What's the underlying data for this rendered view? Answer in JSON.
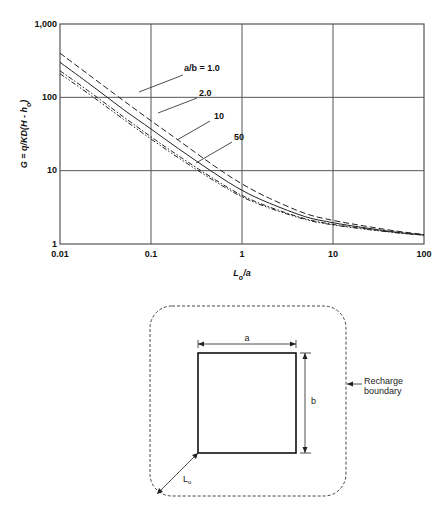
{
  "chart_data": {
    "type": "line",
    "title": "",
    "xlabel": "Lo/a",
    "ylabel": "G = q/KD(H - ho)",
    "xscale": "log",
    "yscale": "log",
    "xlim": [
      0.01,
      100
    ],
    "ylim": [
      1,
      1000
    ],
    "grid": true,
    "x_ticks": [
      "0.01",
      "0.1",
      "1",
      "10",
      "100"
    ],
    "y_ticks": [
      "1",
      "10",
      "100",
      "1,000"
    ],
    "x": [
      0.01,
      0.02,
      0.05,
      0.1,
      0.2,
      0.5,
      1,
      2,
      5,
      10,
      20,
      50,
      100
    ],
    "series": [
      {
        "name": "a/b = 1.0",
        "style": "dashed",
        "values": [
          400,
          210,
          90,
          48,
          26,
          11.5,
          6.6,
          4.2,
          2.6,
          2.1,
          1.8,
          1.5,
          1.35
        ]
      },
      {
        "name": "2.0",
        "style": "solid",
        "values": [
          300,
          160,
          68,
          37,
          20,
          9.2,
          5.4,
          3.6,
          2.35,
          1.95,
          1.7,
          1.45,
          1.33
        ]
      },
      {
        "name": "10",
        "style": "dash-dot",
        "values": [
          230,
          125,
          54,
          29,
          16,
          7.6,
          4.6,
          3.2,
          2.2,
          1.85,
          1.65,
          1.43,
          1.32
        ]
      },
      {
        "name": "50",
        "style": "dash-dot-dot",
        "values": [
          210,
          115,
          50,
          27,
          15,
          7.2,
          4.4,
          3.1,
          2.15,
          1.82,
          1.62,
          1.42,
          1.32
        ]
      }
    ],
    "curve_labels": [
      "a/b = 1.0",
      "2.0",
      "10",
      "50"
    ]
  },
  "diagram": {
    "dimension_a": "a",
    "dimension_b": "b",
    "distance_label": "Lo",
    "boundary_label_line1": "Recharge",
    "boundary_label_line2": "boundary"
  },
  "axis": {
    "ylabel_main": "G = q/KD(H - h",
    "ylabel_sub": "o",
    "ylabel_close": ")",
    "xlabel_main": "L",
    "xlabel_sub": "o",
    "xlabel_tail": "/a"
  }
}
